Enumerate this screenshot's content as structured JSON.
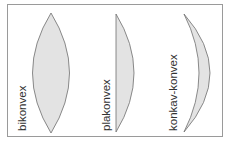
{
  "diagram": {
    "colors": {
      "frame": "#9a9a9a",
      "lens_fill": "#e3e3e3",
      "lens_stroke": "#6e6e6e",
      "text": "#333333"
    },
    "lenses": [
      {
        "id": "bikonvex",
        "label": "bikonvex"
      },
      {
        "id": "plakonvex",
        "label": "plakonvex"
      },
      {
        "id": "konkav-konvex",
        "label": "konkav-konvex"
      }
    ]
  }
}
